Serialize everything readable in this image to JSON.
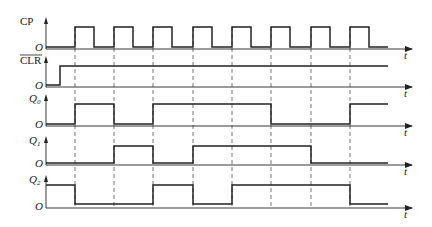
{
  "diagram": {
    "title": "",
    "type": "timing-diagram",
    "time_axis_label": "t",
    "origin_label": "O",
    "clock_edges_x": [
      75,
      114,
      153,
      193,
      232,
      271,
      311,
      350
    ],
    "signals": [
      {
        "name": "CP",
        "label": "CP",
        "overline": false,
        "axis_y": 49,
        "high_y": 27,
        "low_y": 47,
        "levels": "clock",
        "transitions": [
          [
            46,
            0
          ],
          [
            75,
            1
          ],
          [
            94,
            0
          ],
          [
            114,
            1
          ],
          [
            133,
            0
          ],
          [
            153,
            1
          ],
          [
            172,
            0
          ],
          [
            193,
            1
          ],
          [
            212,
            0
          ],
          [
            232,
            1
          ],
          [
            251,
            0
          ],
          [
            271,
            1
          ],
          [
            290,
            0
          ],
          [
            311,
            1
          ],
          [
            330,
            0
          ],
          [
            350,
            1
          ],
          [
            369,
            0
          ],
          [
            388,
            0
          ]
        ]
      },
      {
        "name": "CLR",
        "label": "CLR",
        "overline": true,
        "axis_y": 87,
        "high_y": 66,
        "low_y": 85,
        "transitions": [
          [
            46,
            0
          ],
          [
            60,
            1
          ],
          [
            388,
            1
          ]
        ]
      },
      {
        "name": "Q0",
        "label": "Q",
        "subscript": "0",
        "overline": false,
        "axis_y": 126,
        "high_y": 104,
        "low_y": 124,
        "transitions": [
          [
            46,
            0
          ],
          [
            75,
            1
          ],
          [
            114,
            0
          ],
          [
            153,
            1
          ],
          [
            271,
            0
          ],
          [
            350,
            1
          ],
          [
            388,
            1
          ]
        ]
      },
      {
        "name": "Q1",
        "label": "Q",
        "subscript": "1",
        "overline": false,
        "axis_y": 165,
        "high_y": 146,
        "low_y": 163,
        "transitions": [
          [
            46,
            0
          ],
          [
            114,
            1
          ],
          [
            153,
            0
          ],
          [
            193,
            1
          ],
          [
            311,
            0
          ],
          [
            388,
            0
          ]
        ]
      },
      {
        "name": "Q2",
        "label": "Q",
        "subscript": "2",
        "overline": false,
        "axis_y": 208,
        "high_y": 185,
        "low_y": 204,
        "transitions": [
          [
            46,
            1
          ],
          [
            75,
            0
          ],
          [
            153,
            1
          ],
          [
            193,
            0
          ],
          [
            232,
            1
          ],
          [
            350,
            0
          ],
          [
            388,
            0
          ]
        ]
      }
    ],
    "colors": {
      "line": "#222222",
      "dashed": "#555555",
      "background": "#ffffff"
    }
  }
}
